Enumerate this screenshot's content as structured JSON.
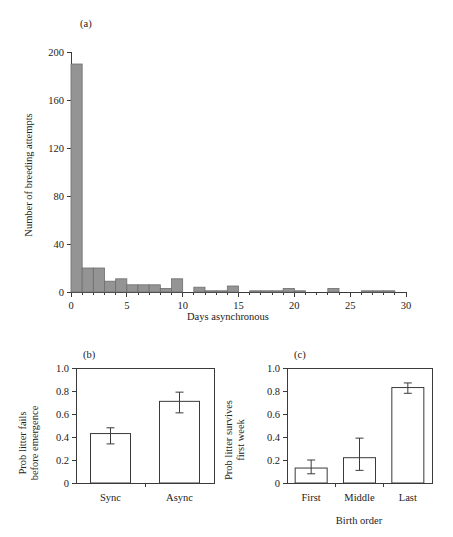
{
  "figure": {
    "panel_a_label": "(a)",
    "panel_b_label": "(b)",
    "panel_c_label": "(c)"
  },
  "chart_data": [
    {
      "type": "bar",
      "panel": "(a)",
      "title": "",
      "xlabel": "Days asynchronous",
      "ylabel": "Number of breeding attempts",
      "xlim": [
        0,
        30
      ],
      "ylim": [
        0,
        200
      ],
      "xticks": [
        0,
        5,
        10,
        15,
        20,
        25,
        30
      ],
      "xtick_labels": [
        "0",
        "5",
        "10",
        "15",
        "20",
        "25",
        "30"
      ],
      "yticks": [
        0,
        40,
        80,
        120,
        160,
        200
      ],
      "ytick_labels": [
        "0",
        "40",
        "80",
        "120",
        "160",
        "200"
      ],
      "grid": false,
      "legend": "none",
      "bar_color": "#949494",
      "categories": [
        0,
        1,
        2,
        3,
        4,
        5,
        6,
        7,
        8,
        9,
        10,
        11,
        12,
        13,
        14,
        15,
        16,
        17,
        18,
        19,
        20,
        21,
        22,
        23,
        24,
        25,
        26,
        27,
        28,
        29
      ],
      "values": [
        190,
        20,
        20,
        9,
        11,
        6,
        6,
        6,
        3,
        11,
        0,
        4,
        1,
        1,
        5,
        0,
        1,
        1,
        1,
        3,
        1,
        0,
        0,
        3,
        0,
        0,
        1,
        1,
        1,
        0
      ]
    },
    {
      "type": "bar",
      "panel": "(b)",
      "title": "",
      "xlabel": "",
      "ylabel": "Prob litter fails before emergence",
      "ylabel_lines": [
        "Prob litter fails",
        "before emergence"
      ],
      "ylim": [
        0,
        1.0
      ],
      "yticks": [
        0,
        0.2,
        0.4,
        0.6,
        0.8,
        1.0
      ],
      "ytick_labels": [
        "0",
        "0.2",
        "0.4",
        "0.6",
        "0.8",
        "1.0"
      ],
      "grid": false,
      "legend": "none",
      "bar_color": "#ffffff",
      "categories": [
        "Sync",
        "Async"
      ],
      "values": [
        0.43,
        0.71
      ],
      "error_low": [
        0.34,
        0.61
      ],
      "error_high": [
        0.48,
        0.79
      ]
    },
    {
      "type": "bar",
      "panel": "(c)",
      "title": "",
      "xlabel": "Birth order",
      "ylabel": "Prob litter survives first week",
      "ylabel_lines": [
        "Prob litter survives",
        "first week"
      ],
      "ylim": [
        0,
        1.0
      ],
      "yticks": [
        0,
        0.2,
        0.4,
        0.6,
        0.8,
        1.0
      ],
      "ytick_labels": [
        "0",
        "0.2",
        "0.4",
        "0.6",
        "0.8",
        "1.0"
      ],
      "grid": false,
      "legend": "none",
      "bar_color": "#ffffff",
      "categories": [
        "First",
        "Middle",
        "Last"
      ],
      "values": [
        0.13,
        0.22,
        0.83
      ],
      "error_low": [
        0.08,
        0.11,
        0.78
      ],
      "error_high": [
        0.2,
        0.39,
        0.87
      ]
    }
  ]
}
